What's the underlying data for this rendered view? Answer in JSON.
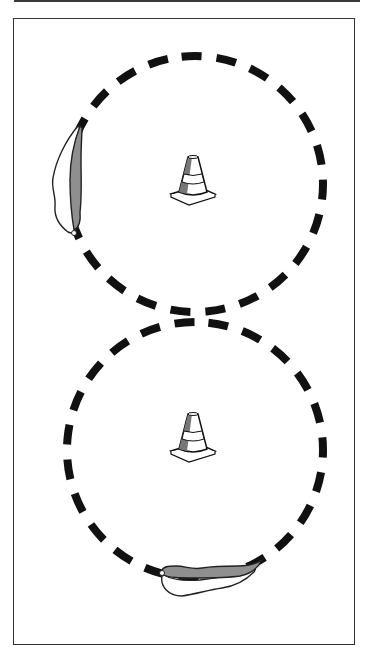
{
  "diagram": {
    "kind": "figure-eight cone drill illustration",
    "colors": {
      "ink": "#111111",
      "frame": "#333333",
      "pepper_fill": "#8f8f8f",
      "pepper_outline": "#222222",
      "cone_shade": "#777777",
      "background": "#ffffff"
    },
    "circles": [
      {
        "name": "top-circle",
        "cx": 195,
        "cy": 184,
        "r": 128,
        "style": "dashed"
      },
      {
        "name": "bottom-circle",
        "cx": 195,
        "cy": 450,
        "r": 128,
        "style": "dashed"
      }
    ],
    "cones": [
      {
        "name": "top-cone",
        "x": 193,
        "y": 180
      },
      {
        "name": "bottom-cone",
        "x": 193,
        "y": 437
      }
    ],
    "markers": [
      {
        "name": "top-circle-pepper",
        "position": "left side of top circle",
        "icon": "chili-pepper-icon"
      },
      {
        "name": "bottom-circle-pepper",
        "position": "bottom of bottom circle",
        "icon": "chili-pepper-icon"
      }
    ]
  }
}
